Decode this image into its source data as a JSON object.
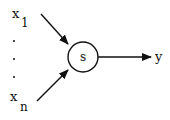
{
  "diagram": {
    "type": "neuron-node",
    "inputs": {
      "first": {
        "symbol": "x",
        "subscript": "1"
      },
      "last": {
        "symbol": "x",
        "subscript": "n"
      },
      "ellipsis": "..."
    },
    "node": {
      "label": "s"
    },
    "output": {
      "label": "y"
    },
    "colors": {
      "stroke": "#111111",
      "background": "#ffffff"
    }
  }
}
